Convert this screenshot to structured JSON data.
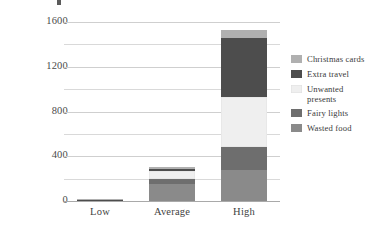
{
  "axis": {
    "ylabel": "kg CO2e per adult",
    "yticks": [
      "0",
      "400",
      "800",
      "1200",
      "1600"
    ],
    "categories": [
      "Low",
      "Average",
      "High"
    ]
  },
  "legend": {
    "items": [
      {
        "label": "Christmas cards",
        "color": "#b0b0b0"
      },
      {
        "label": "Extra travel",
        "color": "#4d4d4d"
      },
      {
        "label": "Unwanted presents",
        "color": "#efefef"
      },
      {
        "label": "Fairy lights",
        "color": "#6e6e6e"
      },
      {
        "label": "Wasted food",
        "color": "#8a8a8a"
      }
    ]
  },
  "chart_data": {
    "type": "bar",
    "subtype": "stacked-vertical",
    "title": "",
    "xlabel": "",
    "ylabel": "kg CO2e per adult",
    "ylim": [
      0,
      1600
    ],
    "ytick_step": 200,
    "ytick_labeled_step": 400,
    "grid": "horizontal",
    "legend_position": "right",
    "categories": [
      "Low",
      "Average",
      "High"
    ],
    "series": [
      {
        "name": "Wasted food",
        "color": "#8a8a8a",
        "values": [
          8,
          150,
          275
        ]
      },
      {
        "name": "Fairy lights",
        "color": "#6e6e6e",
        "values": [
          2,
          45,
          205
        ]
      },
      {
        "name": "Unwanted presents",
        "color": "#efefef",
        "values": [
          2,
          75,
          450
        ]
      },
      {
        "name": "Extra travel",
        "color": "#4d4d4d",
        "values": [
          1,
          20,
          530
        ]
      },
      {
        "name": "Christmas cards",
        "color": "#b0b0b0",
        "values": [
          1,
          10,
          70
        ]
      }
    ],
    "totals": [
      14,
      300,
      1530
    ]
  }
}
